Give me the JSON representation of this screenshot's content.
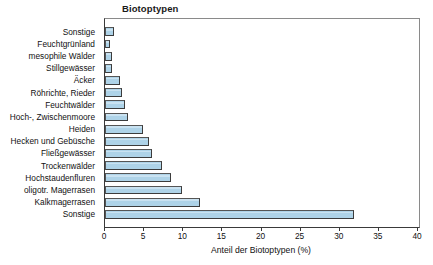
{
  "chart_data": {
    "type": "bar",
    "orientation": "horizontal",
    "title": "Biotoptypen",
    "xlabel": "Anteil der Biotoptypen (%)",
    "ylabel": "",
    "xlim": [
      0,
      40
    ],
    "xticks": [
      0,
      5,
      10,
      15,
      20,
      25,
      30,
      35,
      40
    ],
    "xtick_labels": [
      "0",
      "5",
      "10",
      "15",
      "20",
      "25",
      "30",
      "35",
      "40"
    ],
    "grid": false,
    "legend": null,
    "bar_color": "#aed3e8",
    "bar_edge_color": "#3c3c3c",
    "categories": [
      "Sonstige",
      "Feuchtgrünland",
      "mesophile Wälder",
      "Stillgewässer",
      "Äcker",
      "Röhrichte, Rieder",
      "Feuchtwälder",
      "Hoch-, Zwischenmoore",
      "Heiden",
      "Hecken und Gebüsche",
      "Fließgewässer",
      "Trockenwälder",
      "Hochstaudenfluren",
      "oligotr. Magerrasen",
      "Kalkmagerrasen",
      "Sonstige"
    ],
    "values": [
      1.2,
      0.7,
      0.9,
      0.85,
      1.9,
      2.2,
      2.5,
      2.9,
      4.8,
      5.6,
      6.0,
      7.3,
      8.4,
      9.8,
      12.1,
      31.8
    ]
  }
}
